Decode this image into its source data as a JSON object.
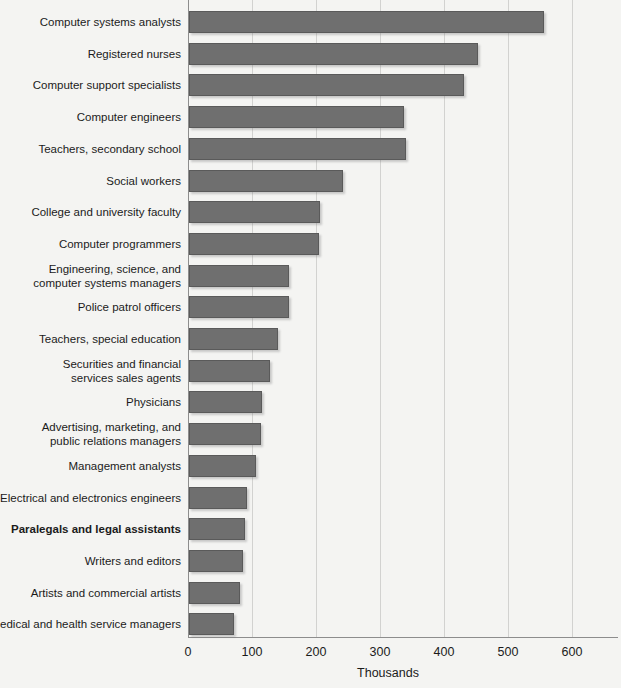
{
  "chart_data": {
    "type": "bar",
    "orientation": "horizontal",
    "title": "",
    "xlabel": "Thousands",
    "ylabel": "",
    "xlim": [
      0,
      600
    ],
    "xticks": [
      0,
      100,
      200,
      300,
      400,
      500,
      600
    ],
    "grid": true,
    "legend": false,
    "bar_color": "#6f6f6f",
    "background_color": "#f4f4f2",
    "highlight_category": "Paralegals and legal assistants",
    "categories": [
      "Computer systems analysts",
      "Registered nurses",
      "Computer support specialists",
      "Computer engineers",
      "Teachers, secondary school",
      "Social workers",
      "College and university faculty",
      "Computer programmers",
      "Engineering, science, and\ncomputer systems managers",
      "Police patrol officers",
      "Teachers, special education",
      "Securities and financial\nservices sales agents",
      "Physicians",
      "Advertising, marketing, and\npublic relations managers",
      "Management analysts",
      "Electrical and electronics engineers",
      "Paralegals and legal assistants",
      "Writers and editors",
      "Artists and commercial artists",
      "Medical and health service managers"
    ],
    "values": [
      555,
      451,
      429,
      336,
      339,
      240,
      205,
      203,
      156,
      156,
      139,
      126,
      114,
      113,
      104,
      90,
      88,
      84,
      79,
      71
    ]
  }
}
